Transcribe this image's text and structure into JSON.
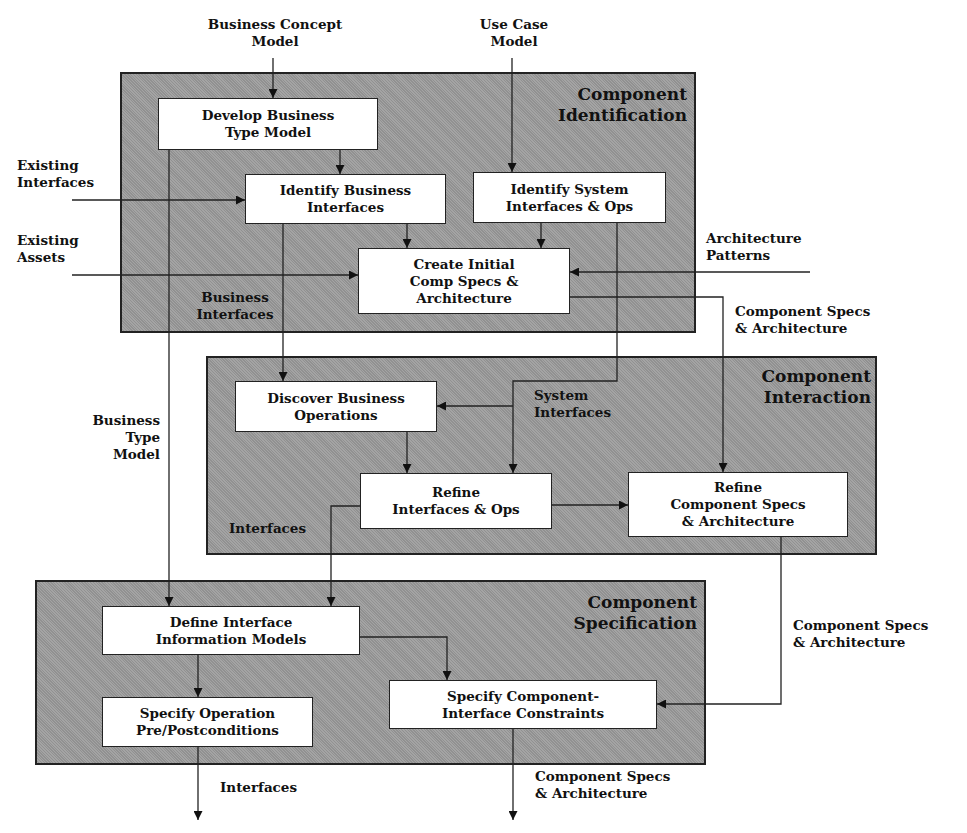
{
  "phases": {
    "identification": {
      "title": [
        "Component",
        "Identification"
      ]
    },
    "interaction": {
      "title": [
        "Component",
        "Interaction"
      ]
    },
    "specification": {
      "title": [
        "Component",
        "Specification"
      ]
    }
  },
  "boxes": {
    "develop_business_type_model": [
      "Develop Business",
      "Type Model"
    ],
    "identify_business_interfaces": [
      "Identify Business",
      "Interfaces"
    ],
    "identify_system_interfaces": [
      "Identify System",
      "Interfaces & Ops"
    ],
    "create_initial_comp_specs": [
      "Create Initial",
      "Comp Specs &",
      "Architecture"
    ],
    "discover_business_operations": [
      "Discover Business",
      "Operations"
    ],
    "refine_interfaces_ops": [
      "Refine",
      "Interfaces & Ops"
    ],
    "refine_component_specs": [
      "Refine",
      "Component Specs",
      "& Architecture"
    ],
    "define_interface_info_models": [
      "Define Interface",
      "Information Models"
    ],
    "specify_operation_conditions": [
      "Specify Operation",
      "Pre/Postconditions"
    ],
    "specify_component_interface_constraints": [
      "Specify Component-",
      "Interface Constraints"
    ]
  },
  "labels": {
    "business_concept_model": [
      "Business Concept",
      "Model"
    ],
    "use_case_model": [
      "Use Case",
      "Model"
    ],
    "existing_interfaces": [
      "Existing",
      "Interfaces"
    ],
    "existing_assets": [
      "Existing",
      "Assets"
    ],
    "architecture_patterns": [
      "Architecture",
      "Patterns"
    ],
    "business_interfaces": [
      "Business",
      "Interfaces"
    ],
    "component_specs_arch_1": [
      "Component Specs",
      "& Architecture"
    ],
    "business_type_model": [
      "Business",
      "Type",
      "Model"
    ],
    "system_interfaces": [
      "System",
      "Interfaces"
    ],
    "interfaces_mid": [
      "Interfaces"
    ],
    "component_specs_arch_2": [
      "Component Specs",
      "& Architecture"
    ],
    "interfaces_out": [
      "Interfaces"
    ],
    "component_specs_arch_out": [
      "Component Specs",
      "& Architecture"
    ]
  },
  "colors": {
    "panel": "#9a9a9a",
    "box": "#ffffff",
    "line": "#222222"
  }
}
